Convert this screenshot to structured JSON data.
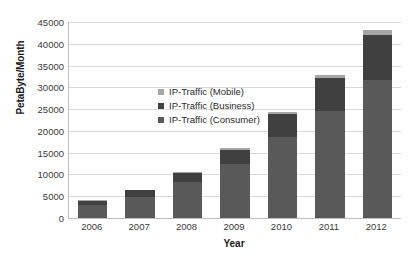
{
  "chart_data": {
    "type": "bar",
    "subtype": "stacked-column",
    "title": "",
    "xlabel": "Year",
    "ylabel": "PetaByte/Month",
    "categories": [
      "2006",
      "2007",
      "2008",
      "2009",
      "2010",
      "2011",
      "2012"
    ],
    "ylim": [
      0,
      45000
    ],
    "ytick_step": 5000,
    "yticks": [
      "45000",
      "40000",
      "35000",
      "30000",
      "25000",
      "20000",
      "15000",
      "10000",
      "5000",
      "0"
    ],
    "ytick_values": [
      45000,
      40000,
      35000,
      30000,
      25000,
      20000,
      15000,
      10000,
      5000,
      0
    ],
    "grid": true,
    "grid_axis": "y",
    "legend_position": "inside-upper-center",
    "series": [
      {
        "name": "IP-Traffic (Consumer)",
        "color": "#595959",
        "values": [
          3000,
          4900,
          8200,
          12300,
          18500,
          24500,
          31800
        ]
      },
      {
        "name": "IP-Traffic (Business)",
        "color": "#404040",
        "values": [
          1000,
          1500,
          2100,
          3400,
          5300,
          7700,
          10200
        ]
      },
      {
        "name": "IP-Traffic (Mobile)",
        "color": "#a6a6a6",
        "values": [
          60,
          110,
          230,
          420,
          500,
          700,
          1200
        ]
      }
    ],
    "totals": [
      4060,
      6510,
      10530,
      16120,
      24300,
      32900,
      43200
    ]
  },
  "legend": {
    "items": [
      {
        "label": "IP-Traffic (Mobile)",
        "color": "#a6a6a6"
      },
      {
        "label": "IP-Traffic (Business)",
        "color": "#404040"
      },
      {
        "label": "IP-Traffic (Consumer)",
        "color": "#595959"
      }
    ]
  },
  "colors": {
    "gridline": "#d9d9d9",
    "axis": "#bfbfbf",
    "text": "#3a3a3a",
    "title_text": "#1a1a1a",
    "background": "#ffffff"
  }
}
